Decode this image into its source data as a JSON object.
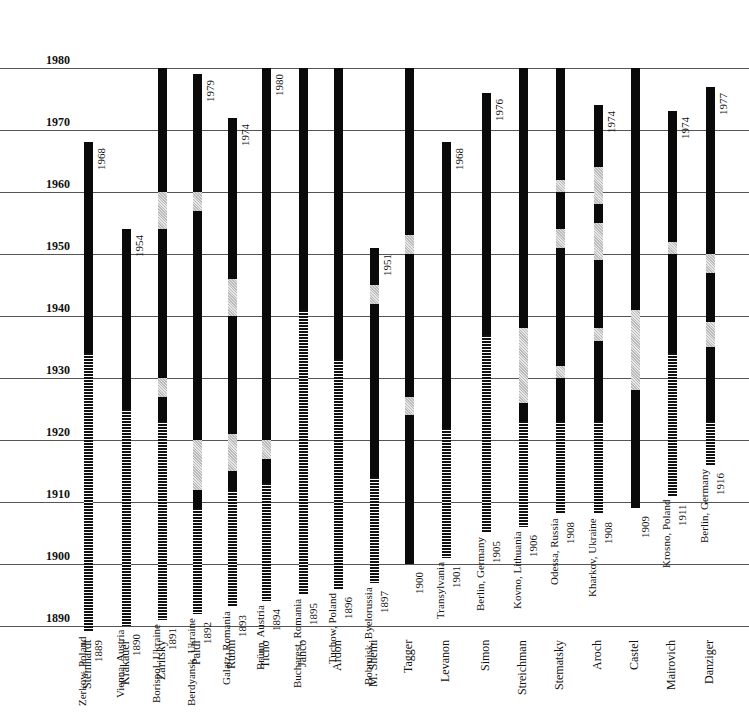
{
  "chart_data": {
    "type": "timeline-bar",
    "title": "",
    "xlabel": "",
    "ylabel": "Year",
    "ylim": [
      1890,
      1980
    ],
    "yticks": [
      1890,
      1900,
      1910,
      1920,
      1930,
      1940,
      1950,
      1960,
      1970,
      1980
    ],
    "grid": true,
    "legend": {
      "hatch": "before immigration (abroad)",
      "solid": "active period",
      "gray": "gap / interruption"
    },
    "series": [
      {
        "name": "Steinhardt",
        "x": 88,
        "birth": "1889",
        "origin": "Zerkow, Poland",
        "end_label": "1968",
        "segments": [
          [
            1889,
            1934,
            "hatch"
          ],
          [
            1934,
            1968,
            "solid"
          ]
        ]
      },
      {
        "name": "Krakauer",
        "x": 126,
        "birth": "1890",
        "origin": "Vienna, Austria",
        "end_label": "1954",
        "segments": [
          [
            1890,
            1925,
            "hatch"
          ],
          [
            1925,
            1954,
            "solid"
          ]
        ]
      },
      {
        "name": "Zaritsky",
        "x": 162,
        "birth": "1891",
        "origin": "Borispol, Ukraine",
        "end_label": "",
        "segments": [
          [
            1891,
            1923,
            "hatch"
          ],
          [
            1923,
            1927,
            "solid"
          ],
          [
            1927,
            1930,
            "gray"
          ],
          [
            1930,
            1954,
            "solid"
          ],
          [
            1954,
            1960,
            "gray"
          ],
          [
            1960,
            1980,
            "solid"
          ]
        ]
      },
      {
        "name": "Paldi",
        "x": 197,
        "birth": "1892",
        "origin": "Berdyansk, Ukraine",
        "end_label": "1979",
        "segments": [
          [
            1892,
            1909,
            "hatch"
          ],
          [
            1909,
            1912,
            "solid"
          ],
          [
            1912,
            1920,
            "gray"
          ],
          [
            1920,
            1957,
            "solid"
          ],
          [
            1957,
            1960,
            "gray"
          ],
          [
            1960,
            1979,
            "solid"
          ]
        ]
      },
      {
        "name": "Rubin",
        "x": 232,
        "birth": "1893",
        "origin": "Galatz, Romania",
        "end_label": "1974",
        "segments": [
          [
            1893,
            1912,
            "hatch"
          ],
          [
            1912,
            1915,
            "solid"
          ],
          [
            1915,
            1921,
            "gray"
          ],
          [
            1921,
            1940,
            "solid"
          ],
          [
            1940,
            1946,
            "gray"
          ],
          [
            1946,
            1972,
            "solid"
          ]
        ]
      },
      {
        "name": "Ticho",
        "x": 266,
        "birth": "1894",
        "origin": "Brünn, Austria",
        "end_label": "1980",
        "segments": [
          [
            1894,
            1913,
            "hatch"
          ],
          [
            1913,
            1917,
            "solid"
          ],
          [
            1917,
            1920,
            "gray"
          ],
          [
            1920,
            1980,
            "solid"
          ]
        ]
      },
      {
        "name": "Janco",
        "x": 303,
        "birth": "1895",
        "origin": "Bucharest, Romania",
        "end_label": "",
        "segments": [
          [
            1895,
            1941,
            "hatch"
          ],
          [
            1941,
            1980,
            "solid"
          ]
        ]
      },
      {
        "name": "Ardon",
        "x": 338,
        "birth": "1896",
        "origin": "Tuchow, Poland",
        "end_label": "",
        "segments": [
          [
            1896,
            1933,
            "hatch"
          ],
          [
            1933,
            1980,
            "solid"
          ]
        ]
      },
      {
        "name": "M. Shemi",
        "x": 374,
        "birth": "1897",
        "origin": "Bobruisk, Byelorussia",
        "end_label": "1951",
        "segments": [
          [
            1897,
            1914,
            "hatch"
          ],
          [
            1914,
            1942,
            "solid"
          ],
          [
            1942,
            1945,
            "gray"
          ],
          [
            1945,
            1951,
            "solid"
          ]
        ]
      },
      {
        "name": "Tagger",
        "x": 409,
        "birth": "1900",
        "origin": "",
        "end_label": "",
        "segments": [
          [
            1900,
            1924,
            "solid"
          ],
          [
            1924,
            1927,
            "gray"
          ],
          [
            1927,
            1950,
            "solid"
          ],
          [
            1950,
            1953,
            "gray"
          ],
          [
            1953,
            1980,
            "solid"
          ]
        ]
      },
      {
        "name": "Levanon",
        "x": 446,
        "birth": "1901",
        "origin": "Transylvania",
        "end_label": "1968",
        "segments": [
          [
            1901,
            1922,
            "hatch"
          ],
          [
            1922,
            1968,
            "solid"
          ]
        ]
      },
      {
        "name": "Simon",
        "x": 486,
        "birth": "1905",
        "origin": "Berlin, Germany",
        "end_label": "1976",
        "segments": [
          [
            1905,
            1937,
            "hatch"
          ],
          [
            1937,
            1976,
            "solid"
          ]
        ]
      },
      {
        "name": "Streichman",
        "x": 523,
        "birth": "1906",
        "origin": "Kovno, Lithuania",
        "end_label": "",
        "segments": [
          [
            1906,
            1923,
            "hatch"
          ],
          [
            1923,
            1926,
            "solid"
          ],
          [
            1926,
            1938,
            "gray"
          ],
          [
            1938,
            1980,
            "solid"
          ]
        ]
      },
      {
        "name": "Stematsky",
        "x": 560,
        "birth": "1908",
        "origin": "Odessa, Russia",
        "end_label": "",
        "segments": [
          [
            1908,
            1923,
            "hatch"
          ],
          [
            1923,
            1930,
            "solid"
          ],
          [
            1930,
            1932,
            "gray"
          ],
          [
            1932,
            1951,
            "solid"
          ],
          [
            1951,
            1954,
            "gray"
          ],
          [
            1954,
            1960,
            "solid"
          ],
          [
            1960,
            1962,
            "gray"
          ],
          [
            1962,
            1980,
            "solid"
          ]
        ]
      },
      {
        "name": "Aroch",
        "x": 598,
        "birth": "1908",
        "origin": "Kharkov, Ukraine",
        "end_label": "1974",
        "segments": [
          [
            1908,
            1923,
            "hatch"
          ],
          [
            1923,
            1936,
            "solid"
          ],
          [
            1936,
            1938,
            "gray"
          ],
          [
            1938,
            1949,
            "solid"
          ],
          [
            1949,
            1955,
            "gray"
          ],
          [
            1955,
            1958,
            "solid"
          ],
          [
            1958,
            1964,
            "gray"
          ],
          [
            1964,
            1974,
            "solid"
          ]
        ]
      },
      {
        "name": "Castel",
        "x": 635,
        "birth": "1909",
        "origin": "",
        "end_label": "",
        "segments": [
          [
            1909,
            1928,
            "solid"
          ],
          [
            1928,
            1941,
            "gray"
          ],
          [
            1941,
            1980,
            "solid"
          ]
        ]
      },
      {
        "name": "Mairovich",
        "x": 672,
        "birth": "1911",
        "origin": "Krosno, Poland",
        "end_label": "1974",
        "segments": [
          [
            1911,
            1934,
            "hatch"
          ],
          [
            1934,
            1950,
            "solid"
          ],
          [
            1950,
            1952,
            "gray"
          ],
          [
            1952,
            1973,
            "solid"
          ]
        ]
      },
      {
        "name": "Danziger",
        "x": 710,
        "birth": "1916",
        "origin": "Berlin, Germany",
        "end_label": "1977",
        "segments": [
          [
            1916,
            1923,
            "hatch"
          ],
          [
            1923,
            1935,
            "solid"
          ],
          [
            1935,
            1939,
            "gray"
          ],
          [
            1939,
            1947,
            "solid"
          ],
          [
            1947,
            1950,
            "gray"
          ],
          [
            1950,
            1977,
            "solid"
          ]
        ]
      }
    ]
  }
}
